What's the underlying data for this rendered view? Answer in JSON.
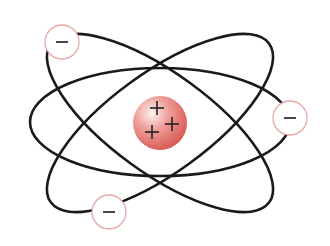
{
  "diagram": {
    "nucleus": {
      "center": [
        160,
        123
      ],
      "radius": 27,
      "color_light": "#fbe3e1",
      "color_mid": "#e98b86",
      "color_dark": "#d9534f",
      "charges": [
        {
          "symbol": "+",
          "x": 157,
          "y": 108
        },
        {
          "symbol": "+",
          "x": 172,
          "y": 124
        },
        {
          "symbol": "+",
          "x": 152,
          "y": 132
        }
      ]
    },
    "orbits": [
      {
        "name": "horizontal-orbit",
        "cx": 160,
        "cy": 122,
        "rx": 130,
        "ry": 54,
        "rotate": 0
      },
      {
        "name": "tilted-orbit-left",
        "cx": 160,
        "cy": 123,
        "rx": 135,
        "ry": 50,
        "rotate": 36
      },
      {
        "name": "tilted-orbit-right",
        "cx": 160,
        "cy": 123,
        "rx": 135,
        "ry": 50,
        "rotate": -36
      }
    ],
    "orbit_color": "#1a1a1a",
    "electrons": [
      {
        "symbol": "−",
        "x": 62,
        "y": 42,
        "r": 17
      },
      {
        "symbol": "−",
        "x": 290,
        "y": 118,
        "r": 17
      },
      {
        "symbol": "−",
        "x": 109,
        "y": 212,
        "r": 17
      }
    ],
    "electron_border_color": "#e8a8a4",
    "electron_fill": "#ffffff"
  }
}
